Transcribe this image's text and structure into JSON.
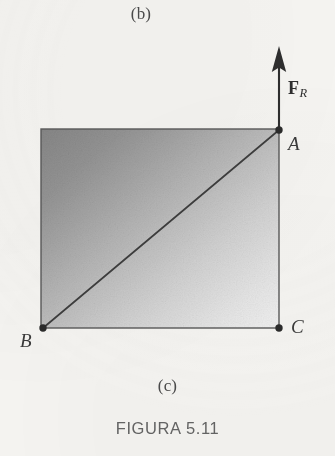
{
  "figure": {
    "caption": "FIGURA 5.11",
    "subfigure_above_label": "(b)",
    "subfigure_current_label": "(c)"
  },
  "diagram": {
    "type": "free-body-parallelogram",
    "points": [
      {
        "id": "A",
        "label": "A",
        "x": 279,
        "y": 130,
        "role": "top-right-vertex"
      },
      {
        "id": "B",
        "label": "B",
        "x": 43,
        "y": 328,
        "role": "bottom-left-vertex"
      },
      {
        "id": "C",
        "label": "C",
        "x": 279,
        "y": 328,
        "role": "bottom-right-vertex"
      }
    ],
    "vector": {
      "symbol": "F",
      "subscript": "R",
      "label": "F_R",
      "direction": "up",
      "tail_x": 279,
      "tail_y": 130,
      "tip_x": 279,
      "tip_y": 48
    },
    "shaded_region": {
      "shape": "rectangle",
      "left": 41,
      "top": 129,
      "right": 279,
      "bottom": 328,
      "fill_dark": "#878787",
      "fill_light": "#efefef"
    },
    "diagonal": {
      "from": "B",
      "to": "A"
    },
    "colors": {
      "page_background": "#f6f5f2",
      "ink": "#3a3a3a",
      "caption": "#636363"
    }
  }
}
